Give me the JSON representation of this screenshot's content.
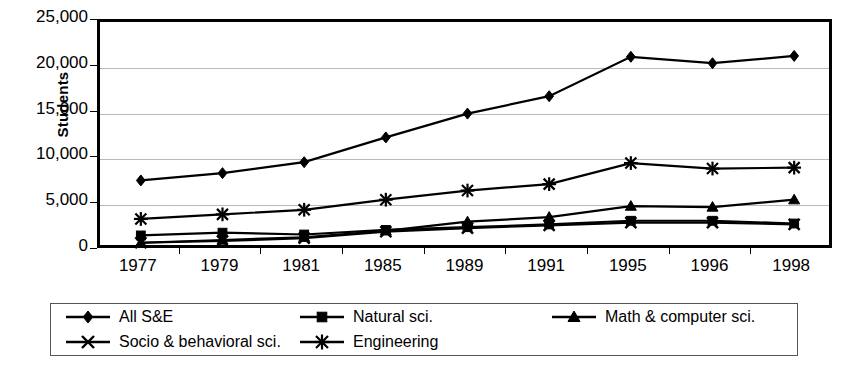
{
  "chart_data": {
    "type": "line",
    "title": "",
    "xlabel": "",
    "ylabel": "Students",
    "categories": [
      "1977",
      "1979",
      "1981",
      "1985",
      "1989",
      "1991",
      "1995",
      "1996",
      "1998"
    ],
    "ylim": [
      0,
      25000
    ],
    "ytick_values": [
      0,
      5000,
      10000,
      15000,
      20000,
      25000
    ],
    "ytick_labels": [
      "0",
      "5,000",
      "10,000",
      "15,000",
      "20,000",
      "25,000"
    ],
    "grid": true,
    "grid_axis": "y",
    "legend_position": "below",
    "legend_rows": 2,
    "colors": {
      "ink": "#000000",
      "grid": "#b9b9b9",
      "background": "#ffffff"
    },
    "series": [
      {
        "name": "All S&E",
        "marker": "diamond",
        "values": [
          7700,
          8500,
          9700,
          12400,
          15000,
          16900,
          21200,
          20500,
          21300
        ]
      },
      {
        "name": "Natural sci.",
        "marker": "square",
        "values": [
          1700,
          2000,
          1800,
          2300,
          2600,
          2900,
          3300,
          3300,
          3000
        ]
      },
      {
        "name": "Math & computer sci.",
        "marker": "triangle",
        "values": [
          900,
          1200,
          1500,
          2200,
          3200,
          3700,
          4900,
          4800,
          5600
        ]
      },
      {
        "name": "Socio & behavioral sci.",
        "marker": "x",
        "values": [
          900,
          1100,
          1400,
          2100,
          2500,
          2800,
          3100,
          3100,
          2900
        ]
      },
      {
        "name": "Engineering",
        "marker": "asterisk",
        "values": [
          3500,
          4000,
          4500,
          5600,
          6600,
          7300,
          9600,
          9000,
          9100
        ]
      }
    ]
  },
  "legend": {
    "entries": [
      {
        "label": "All S&E",
        "marker": "diamond"
      },
      {
        "label": "Natural sci.",
        "marker": "square"
      },
      {
        "label": "Math & computer sci.",
        "marker": "triangle"
      },
      {
        "label": "Socio & behavioral sci.",
        "marker": "x"
      },
      {
        "label": "Engineering",
        "marker": "asterisk"
      }
    ]
  }
}
